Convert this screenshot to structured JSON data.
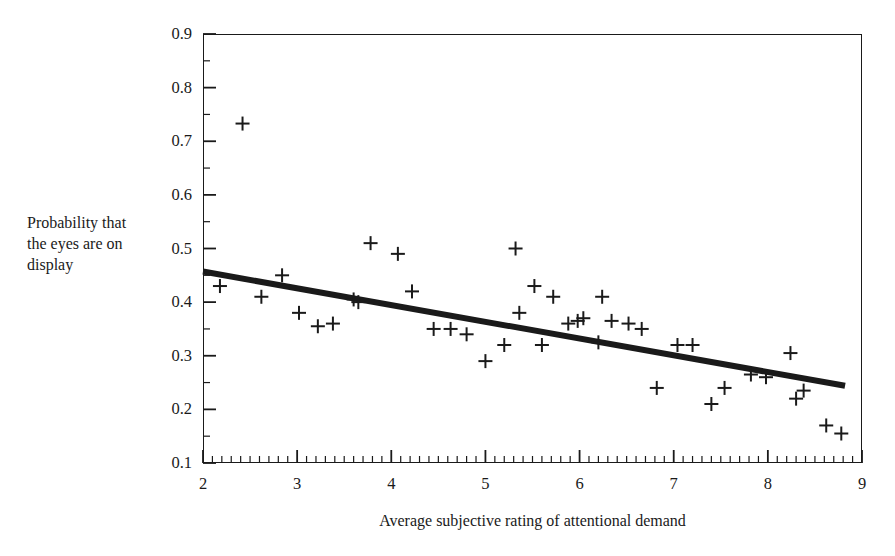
{
  "chart_data": {
    "type": "scatter",
    "title": "",
    "xlabel": "Average subjective rating of attentional demand",
    "ylabel_lines": [
      "Probability that",
      "the eyes are on",
      "display"
    ],
    "ylabel": "Probability that the eyes are on display",
    "xlim": [
      2,
      9
    ],
    "ylim": [
      0.1,
      0.9
    ],
    "xticks": [
      2,
      3,
      4,
      5,
      6,
      7,
      8,
      9
    ],
    "xtick_labels": [
      "2",
      "3",
      "4",
      "5",
      "6",
      "7",
      "8",
      "9"
    ],
    "yticks": [
      0.1,
      0.2,
      0.3,
      0.4,
      0.5,
      0.6,
      0.7,
      0.8,
      0.9
    ],
    "ytick_labels": [
      "0.1",
      "0.2",
      "0.3",
      "0.4",
      "0.5",
      "0.6",
      "0.7",
      "0.8",
      "0.9"
    ],
    "x_minor_tick_step": 0.1,
    "y_minor_tick_step": 0.05,
    "grid": false,
    "legend": null,
    "marker": "plus",
    "marker_color": "#1a1a1a",
    "frame_color": "#1a1a1a",
    "points": [
      {
        "x": 2.18,
        "y": 0.43
      },
      {
        "x": 2.42,
        "y": 0.733
      },
      {
        "x": 2.62,
        "y": 0.41
      },
      {
        "x": 2.84,
        "y": 0.45
      },
      {
        "x": 3.02,
        "y": 0.38
      },
      {
        "x": 3.22,
        "y": 0.355
      },
      {
        "x": 3.38,
        "y": 0.36
      },
      {
        "x": 3.6,
        "y": 0.405
      },
      {
        "x": 3.65,
        "y": 0.4
      },
      {
        "x": 3.78,
        "y": 0.51
      },
      {
        "x": 4.07,
        "y": 0.49
      },
      {
        "x": 4.22,
        "y": 0.42
      },
      {
        "x": 4.45,
        "y": 0.35
      },
      {
        "x": 4.63,
        "y": 0.35
      },
      {
        "x": 4.8,
        "y": 0.34
      },
      {
        "x": 5.0,
        "y": 0.29
      },
      {
        "x": 5.2,
        "y": 0.32
      },
      {
        "x": 5.32,
        "y": 0.5
      },
      {
        "x": 5.36,
        "y": 0.38
      },
      {
        "x": 5.52,
        "y": 0.43
      },
      {
        "x": 5.6,
        "y": 0.32
      },
      {
        "x": 5.72,
        "y": 0.41
      },
      {
        "x": 5.88,
        "y": 0.36
      },
      {
        "x": 5.98,
        "y": 0.365
      },
      {
        "x": 6.04,
        "y": 0.37
      },
      {
        "x": 6.2,
        "y": 0.325
      },
      {
        "x": 6.24,
        "y": 0.41
      },
      {
        "x": 6.34,
        "y": 0.365
      },
      {
        "x": 6.52,
        "y": 0.36
      },
      {
        "x": 6.66,
        "y": 0.35
      },
      {
        "x": 6.82,
        "y": 0.24
      },
      {
        "x": 7.04,
        "y": 0.32
      },
      {
        "x": 7.2,
        "y": 0.32
      },
      {
        "x": 7.4,
        "y": 0.21
      },
      {
        "x": 7.54,
        "y": 0.24
      },
      {
        "x": 7.82,
        "y": 0.265
      },
      {
        "x": 7.98,
        "y": 0.26
      },
      {
        "x": 8.24,
        "y": 0.305
      },
      {
        "x": 8.3,
        "y": 0.22
      },
      {
        "x": 8.38,
        "y": 0.235
      },
      {
        "x": 8.62,
        "y": 0.17
      },
      {
        "x": 8.78,
        "y": 0.155
      }
    ],
    "trend_line": {
      "type": "linear-fit",
      "x_start": 2.0,
      "y_start": 0.457,
      "x_end": 8.82,
      "y_end": 0.244,
      "color": "#1a1a1a",
      "width_px": 6
    }
  }
}
